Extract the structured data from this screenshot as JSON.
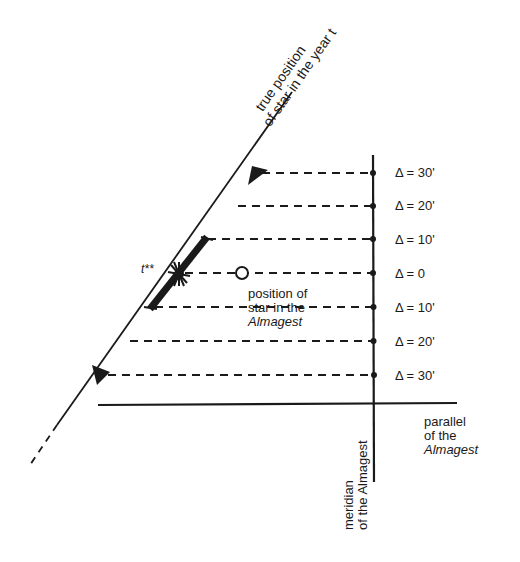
{
  "diagram": {
    "colors": {
      "ink": "#1a1a1a",
      "background": "#ffffff"
    },
    "diagonal_label": {
      "line1": "true position",
      "line2": "of star in the year t"
    },
    "t_label": "t**",
    "almagest_point_label": {
      "line1": "position of",
      "line2": "star in the",
      "line3": "Almagest"
    },
    "delta_levels": [
      {
        "label": "Δ = 30'",
        "y": 173
      },
      {
        "label": "Δ = 20'",
        "y": 206
      },
      {
        "label": "Δ = 10'",
        "y": 239
      },
      {
        "label": "Δ = 0",
        "y": 273
      },
      {
        "label": "Δ = 10'",
        "y": 307
      },
      {
        "label": "Δ = 20'",
        "y": 341
      },
      {
        "label": "Δ = 30'",
        "y": 375
      }
    ],
    "meridian_label": {
      "line1": "meridian",
      "line2": "of the Almagest"
    },
    "parallel_label": {
      "line1": "parallel",
      "line2": "of the",
      "line3": "Almagest"
    }
  }
}
